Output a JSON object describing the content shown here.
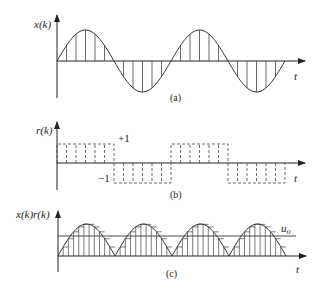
{
  "panels": [
    {
      "id": "a",
      "ylabel": "x(k)",
      "xlabel": "t",
      "caption": "(a)",
      "description": "Sampled sine wave, two periods, vertical sample lines"
    },
    {
      "id": "b",
      "ylabel": "r(k)",
      "xlabel": "t",
      "caption": "(b)",
      "level_pos": "+1",
      "level_neg": "−1",
      "description": "Dashed square-wave reference, +1/-1 alternating each half-period"
    },
    {
      "id": "c",
      "ylabel": "x(k)r(k)",
      "xlabel": "t",
      "caption": "(c)",
      "level_label": "u",
      "level_sub": "o",
      "description": "Rectified product with DC level u_o"
    }
  ],
  "colors": {
    "stroke": "#333333",
    "background": "#ffffff"
  }
}
